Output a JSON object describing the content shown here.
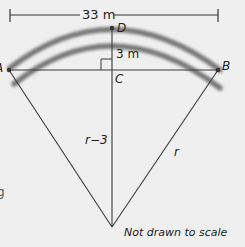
{
  "diagram": {
    "dimension_label": "33 m",
    "height_label": "3 m",
    "points": {
      "A": "A",
      "B": "B",
      "C": "C",
      "D": "D"
    },
    "segment_labels": {
      "vertical": "r−3",
      "slant": "r"
    },
    "note": "Not drawn to scale",
    "edge_fragment": "g",
    "colors": {
      "background": "#efefef",
      "line": "#3a3a3a",
      "arc": "#7a7a7a",
      "text": "#222222"
    }
  }
}
